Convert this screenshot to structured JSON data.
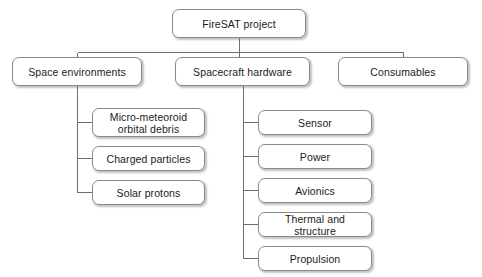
{
  "diagram": {
    "style": {
      "background": "#ffffff",
      "box_fill": "#ffffff",
      "box_border": "#8a8a8a",
      "line_color": "#6e6e6e",
      "text_color": "#1b1b1b"
    },
    "nodes": {
      "root": {
        "label": "FireSAT project",
        "x": 172,
        "y": 9,
        "w": 134,
        "h": 29
      },
      "level2": [
        {
          "label": "Space environments",
          "x": 12,
          "y": 57,
          "w": 130,
          "h": 29
        },
        {
          "label": "Spacecraft hardware",
          "x": 175,
          "y": 57,
          "w": 135,
          "h": 29
        },
        {
          "label": "Consumables",
          "x": 338,
          "y": 57,
          "w": 130,
          "h": 29
        }
      ],
      "space_environments_children": [
        {
          "label": "Micro-meteoroid\norbital debris",
          "x": 92,
          "y": 108,
          "w": 113,
          "h": 29
        },
        {
          "label": "Charged particles",
          "x": 92,
          "y": 146,
          "w": 113,
          "h": 25
        },
        {
          "label": "Solar protons",
          "x": 92,
          "y": 180,
          "w": 113,
          "h": 25
        }
      ],
      "spacecraft_hardware_children": [
        {
          "label": "Sensor",
          "x": 258,
          "y": 110,
          "w": 114,
          "h": 25
        },
        {
          "label": "Power",
          "x": 258,
          "y": 144,
          "w": 114,
          "h": 25
        },
        {
          "label": "Avionics",
          "x": 258,
          "y": 178,
          "w": 114,
          "h": 25
        },
        {
          "label": "Thermal and structure",
          "x": 258,
          "y": 212,
          "w": 114,
          "h": 25
        },
        {
          "label": "Propulsion",
          "x": 258,
          "y": 246,
          "w": 114,
          "h": 25
        }
      ]
    },
    "connectors": {
      "root_stem": {
        "x": 239,
        "y1": 38,
        "y2": 52
      },
      "level2_bus": {
        "y": 52,
        "x1": 77,
        "x2": 403
      },
      "level2_drops": [
        {
          "x": 77,
          "y1": 52,
          "y2": 57
        },
        {
          "x": 239,
          "y1": 52,
          "y2": 57
        },
        {
          "x": 403,
          "y1": 52,
          "y2": 57
        }
      ],
      "left_trunk": {
        "x": 77,
        "y1": 86,
        "y2": 192
      },
      "left_stubs": [
        {
          "x1": 77,
          "x2": 92,
          "y": 122
        },
        {
          "x1": 77,
          "x2": 92,
          "y": 158
        },
        {
          "x1": 77,
          "x2": 92,
          "y": 192
        }
      ],
      "right_trunk": {
        "x": 243,
        "y1": 86,
        "y2": 258
      },
      "right_stubs": [
        {
          "x1": 243,
          "x2": 258,
          "y": 122
        },
        {
          "x1": 243,
          "x2": 258,
          "y": 156
        },
        {
          "x1": 243,
          "x2": 258,
          "y": 190
        },
        {
          "x1": 243,
          "x2": 258,
          "y": 224
        },
        {
          "x1": 243,
          "x2": 258,
          "y": 258
        }
      ]
    }
  }
}
